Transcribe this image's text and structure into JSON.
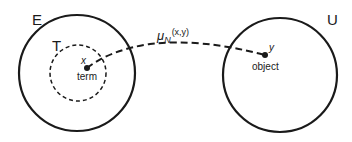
{
  "diagram": {
    "sets": {
      "E": {
        "label": "E"
      },
      "T": {
        "label": "T"
      },
      "U": {
        "label": "U"
      }
    },
    "points": {
      "x": {
        "label": "x",
        "caption": "term"
      },
      "y": {
        "label": "y",
        "caption": "object"
      }
    },
    "mapping": {
      "symbol": "μ",
      "subscript": "N",
      "args": "(x,y)"
    }
  }
}
